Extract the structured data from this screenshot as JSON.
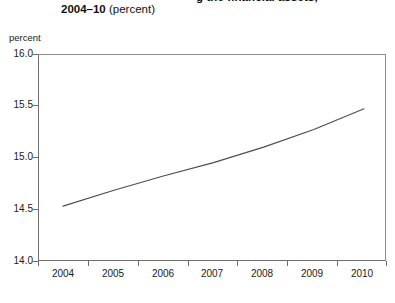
{
  "title": {
    "line1": "g the financial assets,",
    "line2_strong": "2004–10",
    "line2_rest": " (percent)"
  },
  "axis_unit_label": "percent",
  "chart_data": {
    "type": "line",
    "title": "2004–10 (percent)",
    "xlabel": "",
    "ylabel": "percent",
    "x": [
      2004,
      2005,
      2006,
      2007,
      2008,
      2009,
      2010
    ],
    "categories": [
      "2004",
      "2005",
      "2006",
      "2007",
      "2008",
      "2009",
      "2010"
    ],
    "values": [
      14.54,
      14.69,
      14.83,
      14.96,
      15.11,
      15.28,
      15.48
    ],
    "series": [
      {
        "name": "percent",
        "values": [
          14.54,
          14.69,
          14.83,
          14.96,
          15.11,
          15.28,
          15.48
        ]
      }
    ],
    "ylim": [
      14.0,
      16.0
    ],
    "xlim": [
      2004,
      2010
    ],
    "yticks": [
      "16.0",
      "15.5",
      "15.0",
      "14.5",
      "14.0"
    ],
    "ytick_values": [
      16.0,
      15.5,
      15.0,
      14.5,
      14.0
    ],
    "xticks": [
      "2004",
      "2005",
      "2006",
      "2007",
      "2008",
      "2009",
      "2010"
    ],
    "grid": false,
    "legend": false,
    "line_color": "#4d4d4d"
  }
}
